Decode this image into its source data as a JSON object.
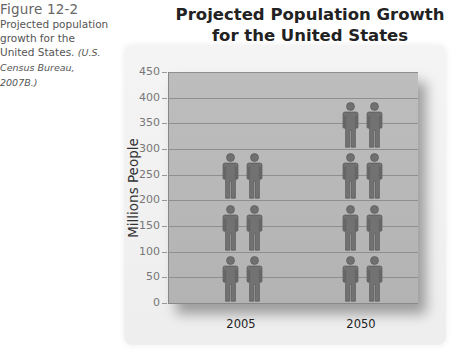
{
  "caption": {
    "figure_label": "Figure 12-2",
    "text": "Projected population growth for the United States.",
    "citation": "(U.S. Census Bureau, 2007B.)"
  },
  "chart_data": {
    "type": "bar",
    "style": "pictograph",
    "title": "Projected Population Growth for the United States",
    "xlabel": "",
    "ylabel": "Millions People",
    "categories": [
      "2005",
      "2050"
    ],
    "values": [
      300,
      400
    ],
    "ylim": [
      0,
      450
    ],
    "yticks": [
      0,
      50,
      100,
      150,
      200,
      250,
      300,
      350,
      400,
      450
    ],
    "grid": true,
    "legend": null,
    "icon": "person-pair",
    "icon_rows": [
      3,
      4
    ]
  },
  "colors": {
    "plot_bg": "#b8b8b8",
    "gridline": "#8f8f8f",
    "icon": "#6e6e6e",
    "panel_bg": "#f1f1f1"
  }
}
